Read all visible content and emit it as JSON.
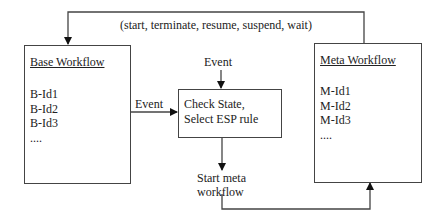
{
  "top_label": "(start, terminate, resume, suspend, wait)",
  "base_workflow": {
    "title": "Base Workflow",
    "items": [
      "B-Id1",
      "B-Id2",
      "B-Id3",
      "...."
    ]
  },
  "meta_workflow": {
    "title": "Meta Workflow",
    "items": [
      "M-Id1",
      "M-Id2",
      "M-Id3",
      "...."
    ]
  },
  "check_box": {
    "line1": "Check State,",
    "line2": "Select ESP rule"
  },
  "event_top_label": "Event",
  "event_left_label": "Event",
  "start_meta": {
    "line1": "Start meta",
    "line2": "workflow"
  }
}
